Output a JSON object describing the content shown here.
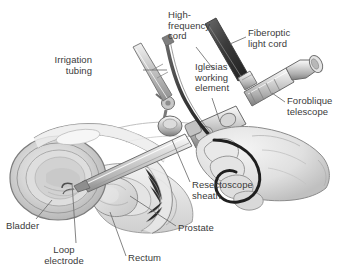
{
  "figure": {
    "background_color": "#ffffff",
    "width": 344,
    "height": 276,
    "style": "grayscale medical line illustration with stipple shading"
  },
  "palette": {
    "text": "#3a3a3a",
    "leader_line": "#6e6e6e",
    "outline": "#4a4a4a",
    "instrument_light": "#d9d9d9",
    "instrument_mid": "#b0b0b0",
    "instrument_dark": "#7a7a7a",
    "cord_dark": "#2b2b2b",
    "tissue_light": "#ededed",
    "tissue_mid": "#d2d2d2",
    "tissue_shadow": "#b5b5b5",
    "bladder_fill": "#dcdcdc",
    "hand_fill": "#e6e6e6",
    "white": "#ffffff"
  },
  "labels": [
    {
      "id": "high-frequency-cord",
      "text": "High-\nfrequency\ncord",
      "align": "left",
      "x": 168,
      "y": 10,
      "leader": {
        "x1": 196,
        "y1": 47,
        "x2": 214,
        "y2": 70
      }
    },
    {
      "id": "fiberoptic-light-cord",
      "text": "Fiberoptic\nlight cord",
      "align": "left",
      "x": 248,
      "y": 28,
      "leader": {
        "x1": 246,
        "y1": 37,
        "x2": 230,
        "y2": 44
      }
    },
    {
      "id": "irrigation-tubing",
      "text": "Irrigation\ntubing",
      "align": "right",
      "x": 92,
      "y": 55,
      "leader": {
        "x1": 143,
        "y1": 70,
        "x2": 167,
        "y2": 70
      }
    },
    {
      "id": "iglesias-working-element",
      "text": "Iglesias\nworking\nelement",
      "align": "left",
      "x": 195,
      "y": 62,
      "leader": {
        "x1": 212,
        "y1": 98,
        "x2": 220,
        "y2": 122
      }
    },
    {
      "id": "foroblique-telescope",
      "text": "Foroblique\ntelescope",
      "align": "left",
      "x": 287,
      "y": 96,
      "leader": {
        "x1": 285,
        "y1": 102,
        "x2": 272,
        "y2": 93
      }
    },
    {
      "id": "resectoscope-sheath",
      "text": "Resectoscope\nsheath",
      "align": "left",
      "x": 192,
      "y": 180,
      "leader": {
        "x1": 190,
        "y1": 182,
        "x2": 172,
        "y2": 140
      }
    },
    {
      "id": "bladder",
      "text": "Bladder",
      "align": "left",
      "x": 6,
      "y": 221,
      "leader": {
        "x1": 36,
        "y1": 219,
        "x2": 52,
        "y2": 200
      }
    },
    {
      "id": "loop-electrode",
      "text": "Loop\nelectrode",
      "align": "center",
      "x": 52,
      "y": 245,
      "leader": {
        "x1": 76,
        "y1": 243,
        "x2": 72,
        "y2": 183
      }
    },
    {
      "id": "rectum",
      "text": "Rectum",
      "align": "left",
      "x": 128,
      "y": 253,
      "leader": {
        "x1": 126,
        "y1": 256,
        "x2": 110,
        "y2": 212
      }
    },
    {
      "id": "prostate",
      "text": "Prostate",
      "align": "left",
      "x": 178,
      "y": 223,
      "leader": {
        "x1": 176,
        "y1": 226,
        "x2": 130,
        "y2": 196
      }
    }
  ],
  "anatomy_parts": [
    "bladder",
    "prostate",
    "rectum",
    "urethra",
    "pelvic-floor-tissue"
  ],
  "instrument_parts": [
    "resectoscope-sheath",
    "iglesias-working-element",
    "foroblique-telescope",
    "fiberoptic-light-cord",
    "high-frequency-cord",
    "irrigation-tubing",
    "loop-electrode",
    "surgeon-hand"
  ]
}
